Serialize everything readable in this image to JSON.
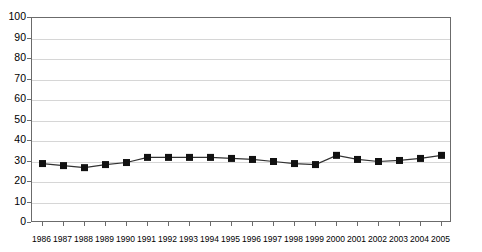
{
  "chart_data": {
    "type": "line",
    "title": "",
    "subtitle": "",
    "xlabel": "",
    "ylabel": "",
    "grid": true,
    "legend": false,
    "ylim": [
      0,
      100
    ],
    "ytick_step": 10,
    "yticks": [
      0,
      10,
      20,
      30,
      40,
      50,
      60,
      70,
      80,
      90,
      100
    ],
    "ytick_labels": [
      "0",
      "10",
      "20",
      "30",
      "40",
      "50",
      "60",
      "70",
      "80",
      "90",
      "100"
    ],
    "categories": [
      "1986",
      "1987",
      "1988",
      "1989",
      "1990",
      "1991",
      "1992",
      "1993",
      "1994",
      "1995",
      "1996",
      "1997",
      "1998",
      "1999",
      "2000",
      "2001",
      "2002",
      "2003",
      "2004",
      "2005"
    ],
    "x": [
      1986,
      1987,
      1988,
      1989,
      1990,
      1991,
      1992,
      1993,
      1994,
      1995,
      1996,
      1997,
      1998,
      1999,
      2000,
      2001,
      2002,
      2003,
      2004,
      2005
    ],
    "values": [
      29,
      28,
      27,
      28.5,
      29.5,
      32,
      32,
      32,
      32,
      31.5,
      31,
      30,
      29,
      28.5,
      33,
      31,
      30,
      30.5,
      31.5,
      33
    ],
    "series": [
      {
        "name": "series-1",
        "values": [
          29,
          28,
          27,
          28.5,
          29.5,
          32,
          32,
          32,
          32,
          31.5,
          31,
          30,
          29,
          28.5,
          33,
          31,
          30,
          30.5,
          31.5,
          33
        ],
        "marker": "square",
        "marker_color": "#111111",
        "line_color": "#333333"
      }
    ],
    "colors": {
      "frame": "#6b6b6b",
      "grid": "#d6d6d6",
      "marker": "#111111",
      "line": "#333333",
      "background": "#ffffff",
      "text": "#000000"
    }
  }
}
